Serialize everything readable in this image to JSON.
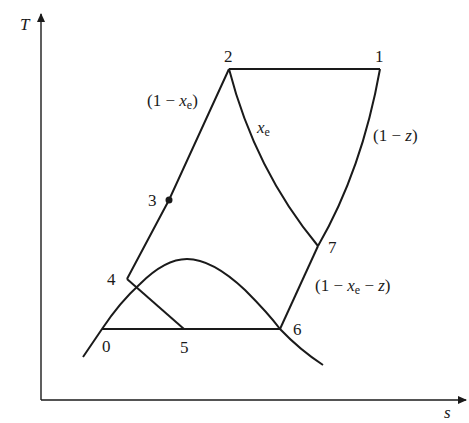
{
  "diagram": {
    "type": "T-s diagram",
    "axes": {
      "y_label": "T",
      "x_label": "s"
    },
    "points": [
      {
        "id": "1",
        "label": "1"
      },
      {
        "id": "2",
        "label": "2"
      },
      {
        "id": "3",
        "label": "3"
      },
      {
        "id": "4",
        "label": "4"
      },
      {
        "id": "0",
        "label": "0"
      },
      {
        "id": "5",
        "label": "5"
      },
      {
        "id": "6",
        "label": "6"
      },
      {
        "id": "7",
        "label": "7"
      }
    ],
    "annotations": {
      "left_branch": {
        "open": "(1 − ",
        "var": "x",
        "sub": "e",
        "close": ")"
      },
      "middle_curve": {
        "var": "x",
        "sub": "e"
      },
      "right_branch": {
        "open": "(1 − ",
        "var": "z",
        "close": ")"
      },
      "lower_right": {
        "open": "(1 − ",
        "var": "x",
        "sub": "e",
        "mid": " − ",
        "var2": "z",
        "close": ")"
      }
    },
    "colors": {
      "line": "#1a1a1a",
      "background": "#ffffff"
    }
  }
}
